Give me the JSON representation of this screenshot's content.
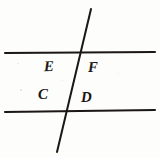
{
  "figure": {
    "background_color": "#fdfdfc",
    "ink_color": "#1a1714",
    "width": 160,
    "height": 157,
    "labels": [
      {
        "id": "E",
        "text": "E",
        "x": 44,
        "y": 59,
        "region": "upper-left-of-transversal-between-lines"
      },
      {
        "id": "F",
        "text": "F",
        "x": 88,
        "y": 60,
        "region": "upper-right-of-transversal-between-lines"
      },
      {
        "id": "C",
        "text": "C",
        "x": 38,
        "y": 87,
        "region": "lower-left-of-transversal-between-lines"
      },
      {
        "id": "D",
        "text": "D",
        "x": 81,
        "y": 90,
        "region": "lower-right-of-transversal-between-lines"
      }
    ],
    "lines": [
      {
        "id": "upper-parallel-line",
        "kind": "horizontal",
        "x1": 5,
        "y1": 53,
        "x2": 155,
        "y2": 52,
        "stroke_width": 2.1
      },
      {
        "id": "lower-parallel-line",
        "kind": "horizontal",
        "x1": 5,
        "y1": 112,
        "x2": 155,
        "y2": 110,
        "stroke_width": 2.1
      },
      {
        "id": "transversal-line",
        "kind": "diagonal",
        "x1": 91,
        "y1": 9,
        "x2": 57,
        "y2": 152,
        "stroke_width": 2.0
      }
    ],
    "intersections": [
      {
        "id": "upper-intersection",
        "x": 79,
        "y": 53
      },
      {
        "id": "lower-intersection",
        "x": 68,
        "y": 111
      }
    ]
  }
}
